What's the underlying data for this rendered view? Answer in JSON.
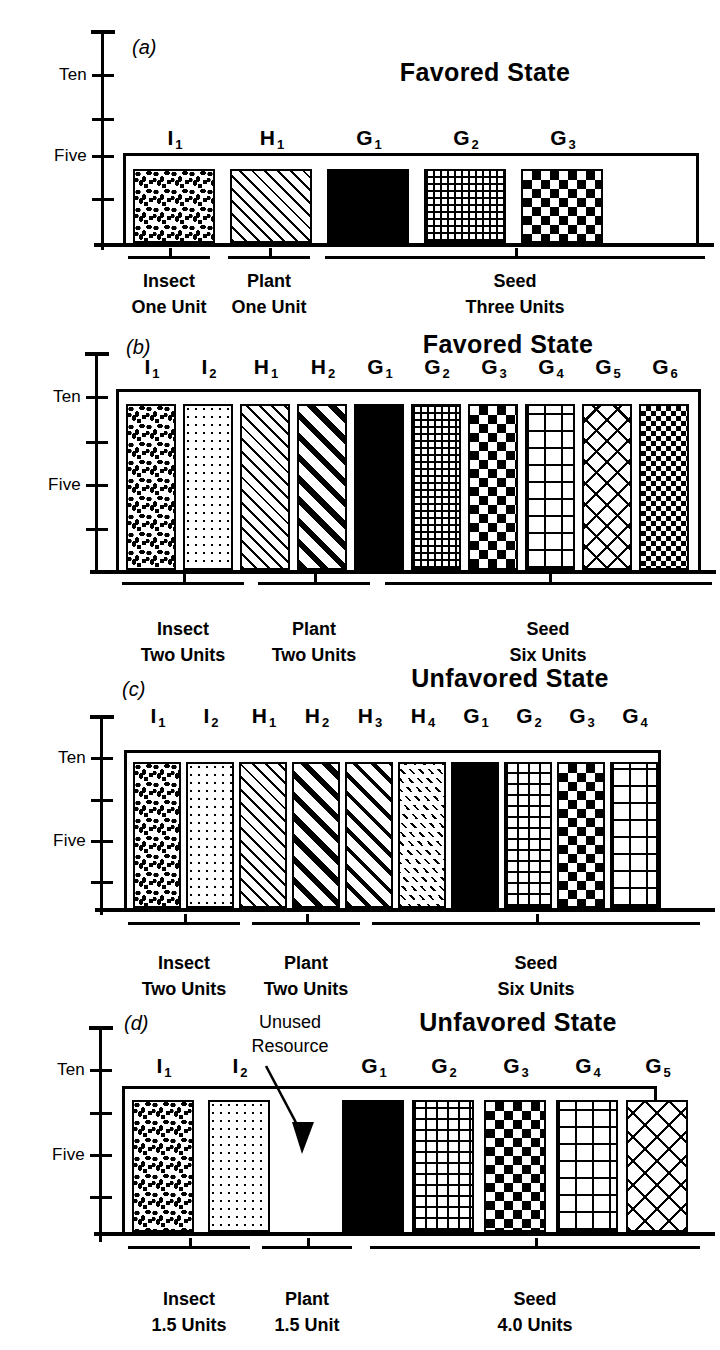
{
  "figure": {
    "axis_labels": {
      "ten": "Ten",
      "five": "Five"
    },
    "groups": {
      "insect": "Insect",
      "plant": "Plant",
      "seed": "Seed"
    },
    "states": {
      "favored": "Favored  State",
      "unfavored": "Unfavored  State"
    },
    "annotation": {
      "line1": "Unused",
      "line2": "Resource"
    }
  },
  "chart_data": {
    "type": "bar",
    "ylabel": "",
    "xlabel": "",
    "ylim": [
      0,
      15
    ],
    "yticks": [
      2.5,
      5,
      7.5,
      10,
      12.5,
      15
    ],
    "ytick_labels": [
      "",
      "Five",
      "",
      "Ten",
      "",
      ""
    ],
    "grid": false,
    "legend": "none",
    "panels": [
      {
        "id": "a",
        "letter": "(a)",
        "state": "Favored  State",
        "ceiling": 5,
        "bars": [
          {
            "label": "I",
            "sub": "1",
            "value": 4.6,
            "pattern": "speckle",
            "group": "insect"
          },
          {
            "label": "H",
            "sub": "1",
            "value": 4.6,
            "pattern": "diag-thin",
            "group": "plant"
          },
          {
            "label": "G",
            "sub": "1",
            "value": 4.6,
            "pattern": "brick",
            "group": "seed"
          },
          {
            "label": "G",
            "sub": "2",
            "value": 4.6,
            "pattern": "grid-fine",
            "group": "seed"
          },
          {
            "label": "G",
            "sub": "3",
            "value": 4.6,
            "pattern": "check",
            "group": "seed"
          }
        ],
        "groups": [
          {
            "name": "insect",
            "title": "Insect",
            "units": "One Unit"
          },
          {
            "name": "plant",
            "title": "Plant",
            "units": "One Unit"
          },
          {
            "name": "seed",
            "title": "Seed",
            "units": "Three Units"
          }
        ]
      },
      {
        "id": "b",
        "letter": "(b)",
        "state": "Favored  State",
        "ceiling": 10,
        "bars": [
          {
            "label": "I",
            "sub": "1",
            "value": 9.7,
            "pattern": "speckle",
            "group": "insect"
          },
          {
            "label": "I",
            "sub": "2",
            "value": 9.7,
            "pattern": "dots",
            "group": "insect"
          },
          {
            "label": "H",
            "sub": "1",
            "value": 9.7,
            "pattern": "diag-thin",
            "group": "plant"
          },
          {
            "label": "H",
            "sub": "2",
            "value": 9.7,
            "pattern": "diag-thick",
            "group": "plant"
          },
          {
            "label": "G",
            "sub": "1",
            "value": 9.7,
            "pattern": "brick",
            "group": "seed"
          },
          {
            "label": "G",
            "sub": "2",
            "value": 9.7,
            "pattern": "grid-fine",
            "group": "seed"
          },
          {
            "label": "G",
            "sub": "3",
            "value": 9.7,
            "pattern": "check",
            "group": "seed"
          },
          {
            "label": "G",
            "sub": "4",
            "value": 9.7,
            "pattern": "grid-large",
            "group": "seed"
          },
          {
            "label": "G",
            "sub": "5",
            "value": 9.7,
            "pattern": "weave",
            "group": "seed"
          },
          {
            "label": "G",
            "sub": "6",
            "value": 9.7,
            "pattern": "check-fine",
            "group": "seed"
          }
        ],
        "groups": [
          {
            "name": "insect",
            "title": "Insect",
            "units": "Two Units"
          },
          {
            "name": "plant",
            "title": "Plant",
            "units": "Two Units"
          },
          {
            "name": "seed",
            "title": "Seed",
            "units": "Six Units"
          }
        ]
      },
      {
        "id": "c",
        "letter": "(c)",
        "state": "Unfavored  State",
        "ceiling": 10,
        "bars": [
          {
            "label": "I",
            "sub": "1",
            "value": 9.6,
            "pattern": "speckle",
            "group": "insect"
          },
          {
            "label": "I",
            "sub": "2",
            "value": 9.6,
            "pattern": "dots",
            "group": "insect"
          },
          {
            "label": "H",
            "sub": "1",
            "value": 9.6,
            "pattern": "diag-thin",
            "group": "plant"
          },
          {
            "label": "H",
            "sub": "2",
            "value": 9.6,
            "pattern": "diag-thick",
            "group": "plant"
          },
          {
            "label": "H",
            "sub": "3",
            "value": 9.6,
            "pattern": "diag-med",
            "group": "plant"
          },
          {
            "label": "H",
            "sub": "4",
            "value": 9.6,
            "pattern": "diag-dash",
            "group": "plant"
          },
          {
            "label": "G",
            "sub": "1",
            "value": 9.6,
            "pattern": "brick",
            "group": "seed"
          },
          {
            "label": "G",
            "sub": "2",
            "value": 9.6,
            "pattern": "grid-med",
            "group": "seed"
          },
          {
            "label": "G",
            "sub": "3",
            "value": 9.6,
            "pattern": "check",
            "group": "seed"
          },
          {
            "label": "G",
            "sub": "4",
            "value": 9.6,
            "pattern": "grid-large",
            "group": "seed"
          }
        ],
        "groups": [
          {
            "name": "insect",
            "title": "Insect",
            "units": "Two Units"
          },
          {
            "name": "plant",
            "title": "Plant",
            "units": "Two Units"
          },
          {
            "name": "seed",
            "title": "Seed",
            "units": "Six Units"
          }
        ]
      },
      {
        "id": "d",
        "letter": "(d)",
        "state": "Unfavored  State",
        "ceiling": 7.5,
        "annotation": {
          "line1": "Unused",
          "line2": "Resource"
        },
        "bars": [
          {
            "label": "I",
            "sub": "1",
            "value": 7.1,
            "pattern": "speckle",
            "group": "insect"
          },
          {
            "label": "I",
            "sub": "2",
            "value": 7.1,
            "pattern": "dots",
            "group": "insect"
          },
          {
            "label": "G",
            "sub": "1",
            "value": 7.1,
            "pattern": "brick",
            "group": "seed"
          },
          {
            "label": "G",
            "sub": "2",
            "value": 7.1,
            "pattern": "grid-med",
            "group": "seed"
          },
          {
            "label": "G",
            "sub": "3",
            "value": 7.1,
            "pattern": "check",
            "group": "seed"
          },
          {
            "label": "G",
            "sub": "4",
            "value": 7.1,
            "pattern": "grid-large",
            "group": "seed"
          },
          {
            "label": "G",
            "sub": "5",
            "value": 7.1,
            "pattern": "weave2",
            "group": "seed"
          }
        ],
        "groups": [
          {
            "name": "insect",
            "title": "Insect",
            "units": "1.5  Units"
          },
          {
            "name": "plant",
            "title": "Plant",
            "units": "1.5  Unit"
          },
          {
            "name": "seed",
            "title": "Seed",
            "units": "4.0  Units"
          }
        ]
      }
    ]
  }
}
